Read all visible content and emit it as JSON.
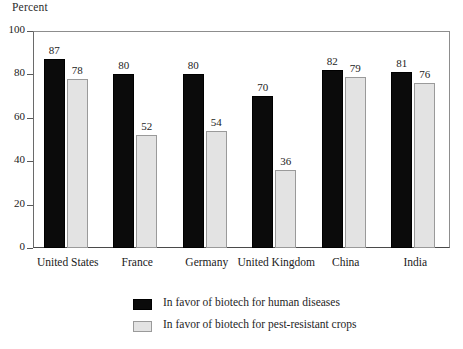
{
  "chart_data": {
    "type": "bar",
    "title": "",
    "ylabel": "Percent",
    "xlabel": "",
    "ylim": [
      0,
      100
    ],
    "yticks": [
      0,
      20,
      40,
      60,
      80,
      100
    ],
    "grid": false,
    "legend_position": "bottom",
    "categories": [
      "United States",
      "France",
      "Germany",
      "United Kingdom",
      "China",
      "India"
    ],
    "series": [
      {
        "name": "In favor of biotech for human diseases",
        "color": "#0b0b0b",
        "values": [
          87,
          80,
          80,
          70,
          82,
          81
        ]
      },
      {
        "name": "In favor of biotech for pest-resistant crops",
        "color": "#e3e3e3",
        "values": [
          78,
          52,
          54,
          36,
          79,
          76
        ]
      }
    ]
  },
  "legend": {
    "items": [
      {
        "label": "In favor of biotech for human diseases",
        "swatch": "dark"
      },
      {
        "label": "In favor of biotech for pest-resistant crops",
        "swatch": "light"
      }
    ]
  }
}
